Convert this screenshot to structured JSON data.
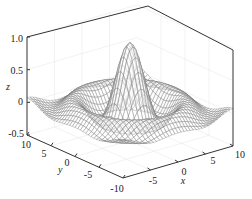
{
  "chart_data": {
    "type": "surface",
    "title": "",
    "function": "z = sin(r)/r, r = sqrt(x^2 + y^2)",
    "xlabel": "x",
    "ylabel": "y",
    "zlabel": "z",
    "xlim": [
      -10,
      10
    ],
    "ylim": [
      -10,
      10
    ],
    "zlim": [
      -0.5,
      1.0
    ],
    "x_ticks": [
      "-5",
      "0",
      "5",
      "10"
    ],
    "y_ticks": [
      "10",
      "5",
      "0",
      "-5",
      "-10"
    ],
    "z_ticks": [
      "1.0",
      "0.5",
      "0",
      "-0.5"
    ],
    "grid": true,
    "style": "mesh wireframe, gray lines on white",
    "peak": {
      "x": 0,
      "y": 0,
      "z": 1.0
    }
  },
  "colors": {
    "axis": "#333333",
    "mesh": "#777777",
    "grid": "#e4e4e4",
    "background": "#ffffff"
  }
}
